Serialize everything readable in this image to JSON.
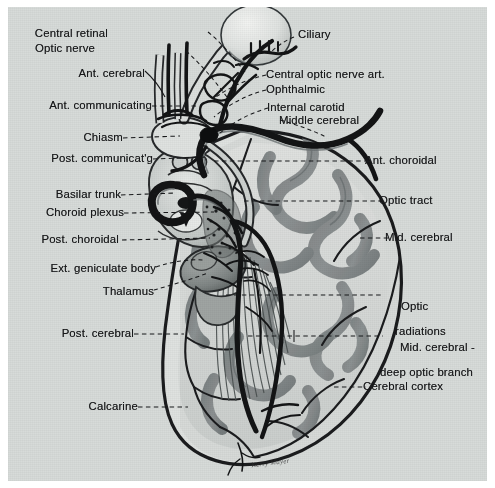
{
  "figure": {
    "background_color": "#d7dbd9",
    "border_color": "#ffffff",
    "ink_color": "#17181a",
    "signature": "Kerry Mayer"
  },
  "labels_left": [
    {
      "text": "Central retinal",
      "x": 113,
      "y": 27
    },
    {
      "text": "Optic nerve",
      "x": 100,
      "y": 42
    },
    {
      "text": "Ant. cerebral",
      "x": 58,
      "y": 67
    },
    {
      "text": "Ant. communicating",
      "x": 22,
      "y": 99
    },
    {
      "text": "Chiasm",
      "x": 74,
      "y": 131
    },
    {
      "text": "Post. communicat'g",
      "x": 23,
      "y": 152
    },
    {
      "text": "Basilar trunk",
      "x": 39,
      "y": 188
    },
    {
      "text": "Choroid plexus",
      "x": 28,
      "y": 206
    },
    {
      "text": "Post. choroidal",
      "x": 27,
      "y": 233
    },
    {
      "text": "Ext. geniculate body",
      "x": 18,
      "y": 262
    },
    {
      "text": "Thalamus",
      "x": 88,
      "y": 285
    },
    {
      "text": "Post. cerebral",
      "x": 56,
      "y": 327
    },
    {
      "text": "Calcarine",
      "x": 73,
      "y": 400
    }
  ],
  "labels_right": [
    {
      "text": "Ciliary",
      "x": 298,
      "y": 28
    },
    {
      "text": "Central optic nerve art.",
      "x": 266,
      "y": 68
    },
    {
      "text": "Ophthalmic",
      "x": 266,
      "y": 83
    },
    {
      "text": "Internal carotid",
      "x": 267,
      "y": 101
    },
    {
      "text": "Middle cerebral",
      "x": 279,
      "y": 114
    },
    {
      "text": "Ant. choroidal",
      "x": 365,
      "y": 154
    },
    {
      "text": "Optic tract",
      "x": 379,
      "y": 194
    },
    {
      "text": "Mid. cerebral",
      "x": 385,
      "y": 231
    },
    {
      "text": "Optic",
      "x": 381,
      "y": 288,
      "line2": "radiations"
    },
    {
      "text": "Mid. cerebral -",
      "x": 380,
      "y": 329,
      "line2": "deep optic branch"
    },
    {
      "text": "Cerebral cortex",
      "x": 363,
      "y": 380
    }
  ],
  "leaders": [
    {
      "name": "central-retinal",
      "kind": "dashed"
    },
    {
      "name": "optic-nerve",
      "kind": "dashed"
    },
    {
      "name": "ant-cerebral",
      "kind": "solid"
    },
    {
      "name": "ant-communicating",
      "kind": "dashed"
    },
    {
      "name": "chiasm",
      "kind": "dashed"
    },
    {
      "name": "post-communicating",
      "kind": "dashed"
    },
    {
      "name": "basilar-trunk",
      "kind": "dashed"
    },
    {
      "name": "choroid-plexus",
      "kind": "dashed"
    },
    {
      "name": "post-choroidal",
      "kind": "dashed"
    },
    {
      "name": "ext-geniculate-body",
      "kind": "dashed"
    },
    {
      "name": "thalamus",
      "kind": "dashed"
    },
    {
      "name": "post-cerebral",
      "kind": "dashed"
    },
    {
      "name": "calcarine",
      "kind": "dashed"
    },
    {
      "name": "ciliary",
      "kind": "dashed"
    },
    {
      "name": "central-optic-nerve-art",
      "kind": "dashed"
    },
    {
      "name": "ophthalmic",
      "kind": "dashed"
    },
    {
      "name": "internal-carotid",
      "kind": "dashed"
    },
    {
      "name": "middle-cerebral",
      "kind": "dashed"
    },
    {
      "name": "ant-choroidal",
      "kind": "dashed"
    },
    {
      "name": "optic-tract",
      "kind": "dashed"
    },
    {
      "name": "mid-cerebral",
      "kind": "dashed"
    },
    {
      "name": "optic-radiations",
      "kind": "dashed"
    },
    {
      "name": "mid-cerebral-deep",
      "kind": "dashed"
    },
    {
      "name": "cerebral-cortex",
      "kind": "dashed"
    }
  ]
}
